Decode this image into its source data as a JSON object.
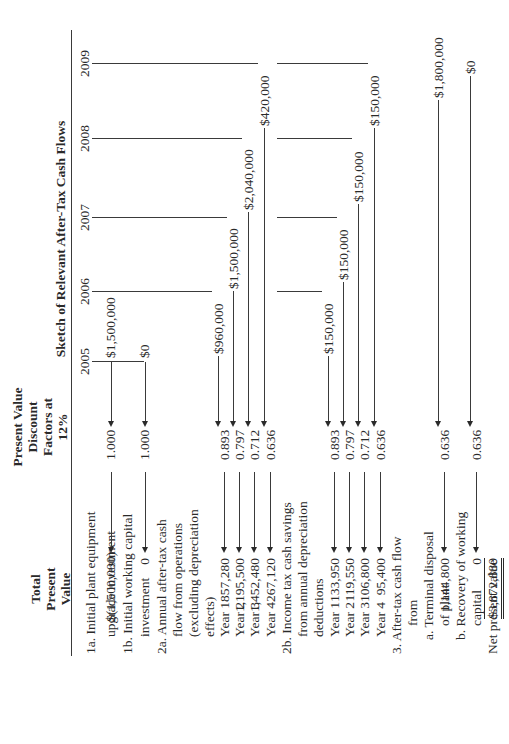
{
  "headers": {
    "total_pv": [
      "Total",
      "Present",
      "Value"
    ],
    "discount": [
      "Present Value",
      "Discount",
      "Factors at",
      "12%"
    ],
    "sketch_title": "Sketch of Relevant After-Tax Cash Flows",
    "years": [
      "2005",
      "2006",
      "2007",
      "2008",
      "2009"
    ]
  },
  "rows": [
    {
      "label": "1a. Initial plant equipment",
      "indent": 0
    },
    {
      "label": "upgrade investment",
      "indent": 1,
      "total_pv": "$(1,500,000)",
      "factor": "1.000"
    },
    {
      "label": "1b. Initial working capital",
      "indent": 0
    },
    {
      "label": "investment",
      "indent": 1,
      "total_pv": "0",
      "factor": "1.000"
    },
    {
      "label": "2a. Annual after-tax cash",
      "indent": 0
    },
    {
      "label": "flow from operations",
      "indent": 1
    },
    {
      "label": "(excluding depreciation",
      "indent": 1
    },
    {
      "label": "effects)",
      "indent": 1
    },
    {
      "label": "Year 1",
      "indent": 1,
      "total_pv": "857,280",
      "factor": "0.893"
    },
    {
      "label": "Year 2",
      "indent": 1,
      "total_pv": "1,195,500",
      "factor": "0.797"
    },
    {
      "label": "Year 3",
      "indent": 1,
      "total_pv": "1,452,480",
      "factor": "0.712"
    },
    {
      "label": "Year 4",
      "indent": 1,
      "total_pv": "267,120",
      "factor": "0.636"
    },
    {
      "label": "2b. Income tax cash savings",
      "indent": 0
    },
    {
      "label": "from annual depreciation",
      "indent": 1
    },
    {
      "label": "deductions",
      "indent": 1
    },
    {
      "label": "Year 1",
      "indent": 1,
      "total_pv": "133,950",
      "factor": "0.893"
    },
    {
      "label": "Year 2",
      "indent": 1,
      "total_pv": "119,550",
      "factor": "0.797"
    },
    {
      "label": "Year 3",
      "indent": 1,
      "total_pv": "106,800",
      "factor": "0.712"
    },
    {
      "label": "Year 4",
      "indent": 1,
      "total_pv": "95,400",
      "factor": "0.636"
    },
    {
      "label": "3.  After-tax cash flow",
      "indent": 0
    },
    {
      "label": "from",
      "indent": 2
    },
    {
      "label": "a. Terminal disposal",
      "indent": 1
    },
    {
      "label": "of plant",
      "indent": 2,
      "total_pv": "1,144,800",
      "factor": "0.636"
    },
    {
      "label": "b. Recovery of working",
      "indent": 1
    },
    {
      "label": "capital",
      "indent": 2,
      "total_pv": "0",
      "factor": "0.636"
    },
    {
      "label": "Net present value",
      "indent": 0,
      "total_pv": "$3,872,880"
    }
  ],
  "cash_flows": {
    "initial_investment": "$1,500,000",
    "initial_working_capital": "$0",
    "operations": [
      "$960,000",
      "$1,500,000",
      "$2,040,000",
      "$420,000"
    ],
    "tax_savings": [
      "$150,000",
      "$150,000",
      "$150,000",
      "$150,000"
    ],
    "terminal_disposal": "$1,800,000",
    "working_capital_recovery": "$0"
  }
}
